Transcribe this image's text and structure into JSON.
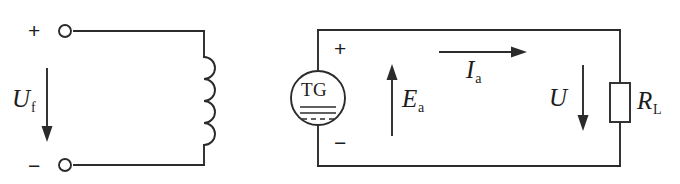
{
  "figure": {
    "type": "circuit-schematic",
    "line_color": "#2b2b2b",
    "background_color": "#ffffff"
  },
  "field_circuit": {
    "name": "field-winding-circuit",
    "positive_terminal_sign": "+",
    "negative_terminal_sign": "−",
    "voltage_label": "U",
    "voltage_subscript": "f",
    "voltage_arrow_direction": "down",
    "inductor_label": "",
    "inductor_turns": 4
  },
  "armature_circuit": {
    "name": "armature-circuit",
    "source_label": "TG",
    "source_type": "dc-tachogenerator",
    "positive_sign": "+",
    "negative_sign": "−",
    "emf_label": "E",
    "emf_subscript": "a",
    "emf_arrow_direction": "up",
    "current_label": "I",
    "current_subscript": "a",
    "current_arrow_direction": "right",
    "terminal_voltage_label": "U",
    "terminal_voltage_arrow_direction": "down",
    "load_label": "R",
    "load_subscript": "L"
  }
}
